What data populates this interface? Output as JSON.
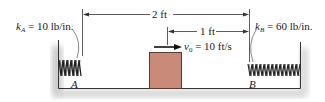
{
  "diagram": {
    "spring_a": {
      "symbol": "k",
      "subscript": "A",
      "value": "= 10 lb/in.",
      "point_label": "A"
    },
    "spring_b": {
      "symbol": "k",
      "subscript": "B",
      "value": "= 60 lb/in.",
      "point_label": "B"
    },
    "dimensions": {
      "total": "2 ft",
      "partial": "1 ft"
    },
    "velocity": {
      "symbol": "v",
      "subscript": "0",
      "value": "= 10 ft/s"
    },
    "colors": {
      "block": "#c98a7a",
      "block_edge": "#5a3a32",
      "line": "#333333",
      "shadow": "#cfcfcf"
    }
  }
}
